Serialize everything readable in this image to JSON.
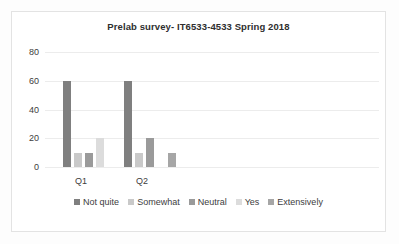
{
  "chart_data": {
    "type": "bar",
    "title": "Prelab survey- IT6533-4533 Spring 2018",
    "xlabel": "",
    "ylabel": "",
    "ylim": [
      0,
      80
    ],
    "yticks": [
      "0",
      "20",
      "40",
      "60",
      "80"
    ],
    "grid": true,
    "legend_position": "bottom",
    "categories": [
      "Q1",
      "Q2"
    ],
    "series": [
      {
        "name": "Not quite",
        "color": "#7f7f7f",
        "values": [
          60,
          60
        ]
      },
      {
        "name": "Somewhat",
        "color": "#c9c9c9",
        "values": [
          10,
          10
        ]
      },
      {
        "name": "Neutral",
        "color": "#9a9a9a",
        "values": [
          10,
          20
        ]
      },
      {
        "name": "Yes",
        "color": "#dcdcdc",
        "values": [
          20,
          0
        ]
      },
      {
        "name": "Extensively",
        "color": "#a6a6a6",
        "values": [
          0,
          10
        ]
      }
    ]
  }
}
